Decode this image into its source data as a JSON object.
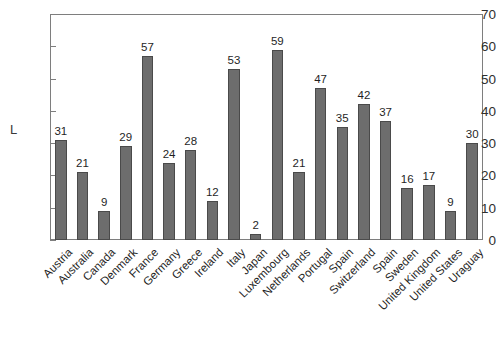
{
  "chart_data": {
    "type": "bar",
    "title": "",
    "subtitle": "",
    "xlabel": "",
    "ylabel": "L",
    "ylim": [
      0,
      70
    ],
    "yticks": [
      0,
      10,
      20,
      30,
      40,
      50,
      60,
      70
    ],
    "grid": false,
    "legend": null,
    "bar_color": "#6d6d6d",
    "bar_edge_color": "#4a4a4a",
    "frame_color": "#7e7e7e",
    "background": "#ffffff",
    "value_labels_shown": true,
    "categories": [
      "Austria",
      "Australia",
      "Canada",
      "Denmark",
      "France",
      "Germany",
      "Greece",
      "Ireland",
      "Italy",
      "Japan",
      "Luxembourg",
      "Netherlands",
      "Portugal",
      "Spain",
      "Switzerland",
      "Spain",
      "Sweden",
      "United Kingdom",
      "United States",
      "Uraguay"
    ],
    "values": [
      31,
      21,
      9,
      29,
      57,
      24,
      28,
      12,
      53,
      2,
      59,
      21,
      47,
      35,
      42,
      37,
      16,
      17,
      9,
      30
    ]
  }
}
